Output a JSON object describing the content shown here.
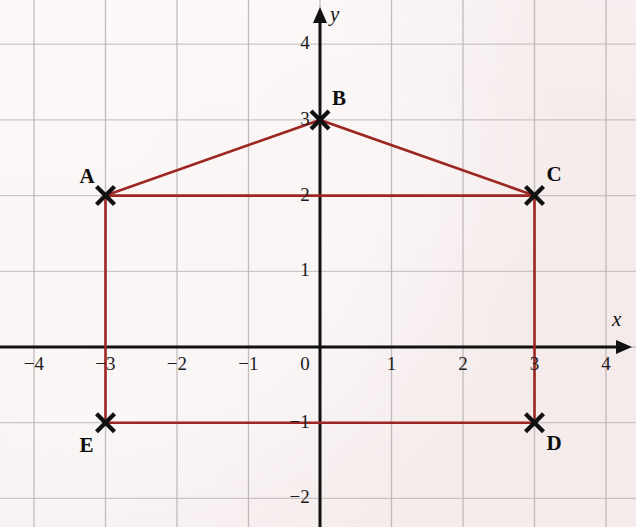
{
  "figure": {
    "kind": "coordinate-grid-plot",
    "background_color": "#f7efef",
    "grid_color": "#b9b3b3",
    "axis_color": "#111111",
    "shape_color": "#9c2622",
    "marker_color": "#111111"
  },
  "axes": {
    "x_label": "x",
    "y_label": "y",
    "x_range": [
      -4.4,
      4.4
    ],
    "y_range": [
      -2.5,
      4.4
    ],
    "origin_px": [
      320,
      347
    ],
    "unit_px": [
      71.5,
      75.7
    ],
    "x_ticks": [
      {
        "value": -4,
        "label": "−4"
      },
      {
        "value": -3,
        "label": "−3"
      },
      {
        "value": -2,
        "label": "−2"
      },
      {
        "value": -1,
        "label": "−1"
      },
      {
        "value": 0,
        "label": "0"
      },
      {
        "value": 1,
        "label": "1"
      },
      {
        "value": 2,
        "label": "2"
      },
      {
        "value": 3,
        "label": "3"
      },
      {
        "value": 4,
        "label": "4"
      }
    ],
    "y_ticks": [
      {
        "value": 4,
        "label": "4"
      },
      {
        "value": 3,
        "label": "3"
      },
      {
        "value": 2,
        "label": "2"
      },
      {
        "value": 1,
        "label": "1"
      },
      {
        "value": 0,
        "label": "0"
      },
      {
        "value": -1,
        "label": "−1"
      },
      {
        "value": -2,
        "label": "−2"
      }
    ]
  },
  "chart_data": {
    "type": "scatter",
    "title": "",
    "xlabel": "x",
    "ylabel": "y",
    "xlim": [
      -4.4,
      4.4
    ],
    "ylim": [
      -2.5,
      4.4
    ],
    "grid": true,
    "legend": "none",
    "points": [
      {
        "label": "A",
        "x": -3,
        "y": 2,
        "label_pos": "above-left"
      },
      {
        "label": "B",
        "x": 0,
        "y": 3,
        "label_pos": "above-right"
      },
      {
        "label": "C",
        "x": 3,
        "y": 2,
        "label_pos": "above-right"
      },
      {
        "label": "D",
        "x": 3,
        "y": -1,
        "label_pos": "below-right"
      },
      {
        "label": "E",
        "x": -3,
        "y": -1,
        "label_pos": "below-left"
      }
    ],
    "polygon": {
      "name": "pentagon-ABCDE",
      "closed": true,
      "vertex_order": [
        "A",
        "B",
        "C",
        "D",
        "E"
      ],
      "color": "#9c2622"
    },
    "extra_segments": [
      {
        "from": "A",
        "to": "C",
        "note": "horizontal chord at y = 2"
      }
    ]
  }
}
